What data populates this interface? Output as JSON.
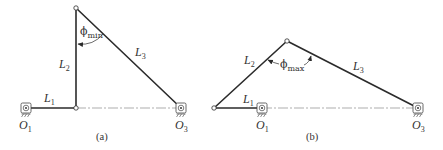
{
  "figure_a": {
    "caption": "(a)",
    "angle_label": {
      "symbol": "ϕ",
      "subscript": "min"
    },
    "labels": {
      "L1": {
        "main": "L",
        "sub": "1"
      },
      "L2": {
        "main": "L",
        "sub": "2"
      },
      "L3": {
        "main": "L",
        "sub": "3"
      },
      "O1": {
        "main": "O",
        "sub": "1"
      },
      "O3": {
        "main": "O",
        "sub": "3"
      }
    }
  },
  "figure_b": {
    "caption": "(b)",
    "angle_label": {
      "symbol": "ϕ",
      "subscript": "max"
    },
    "labels": {
      "L1": {
        "main": "L",
        "sub": "1"
      },
      "L2": {
        "main": "L",
        "sub": "2"
      },
      "L3": {
        "main": "L",
        "sub": "3"
      },
      "O1": {
        "main": "O",
        "sub": "1"
      },
      "O3": {
        "main": "O",
        "sub": "3"
      }
    }
  },
  "colors": {
    "link": "#2b2b2b",
    "centerline": "#8a8a8a",
    "text": "#333333"
  }
}
